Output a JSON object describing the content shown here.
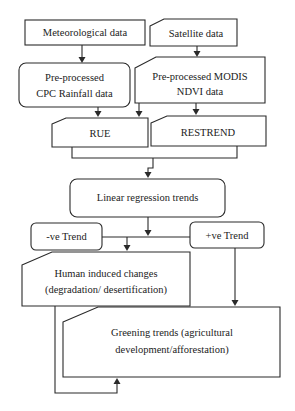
{
  "diagram": {
    "type": "flowchart",
    "nodes": {
      "meteorological": {
        "label": "Meteorological data",
        "shape": "rectangle"
      },
      "satellite": {
        "label": "Satellite data",
        "shape": "card"
      },
      "cpc": {
        "line1": "Pre-processed",
        "line2": "CPC Rainfall data",
        "shape": "rounded-rectangle"
      },
      "modis": {
        "line1": "Pre-processed MODIS",
        "line2": "NDVI data",
        "shape": "card"
      },
      "rue": {
        "label": "RUE",
        "shape": "card"
      },
      "restrend": {
        "label": "RESTREND",
        "shape": "card"
      },
      "linear": {
        "label": "Linear regression trends",
        "shape": "rounded-rectangle"
      },
      "neg_trend": {
        "label": "-ve Trend",
        "shape": "rounded-rectangle"
      },
      "pos_trend": {
        "label": "+ve Trend",
        "shape": "rounded-rectangle"
      },
      "human": {
        "line1": "Human induced changes",
        "line2": "(degradation/ desertification)",
        "shape": "card"
      },
      "greening": {
        "line1": "Greening trends (agricultural",
        "line2": "development/afforestation)",
        "shape": "card"
      }
    },
    "edges": [
      {
        "from": "Meteorological data",
        "to": "Pre-processed CPC Rainfall data"
      },
      {
        "from": "Satellite data",
        "to": "Pre-processed MODIS NDVI data"
      },
      {
        "from": "Pre-processed CPC Rainfall data",
        "to": "RUE"
      },
      {
        "from": "Pre-processed MODIS NDVI data",
        "to": "RUE"
      },
      {
        "from": "Pre-processed MODIS NDVI data",
        "to": "RESTREND"
      },
      {
        "from": "RUE",
        "to": "Linear regression trends"
      },
      {
        "from": "RESTREND",
        "to": "Linear regression trends"
      },
      {
        "from": "Linear regression trends",
        "to": "-ve Trend / +ve Trend"
      },
      {
        "from": "-ve Trend",
        "to": "Human induced changes (degradation/ desertification)"
      },
      {
        "from": "+ve Trend",
        "to": "Greening trends (agricultural development/afforestation)"
      },
      {
        "from": "Human induced changes (degradation/ desertification)",
        "to": "Greening trends (agricultural development/afforestation)"
      }
    ],
    "colors": {
      "stroke": "#2a2a2a",
      "fill": "#ffffff",
      "text": "#222222"
    }
  }
}
